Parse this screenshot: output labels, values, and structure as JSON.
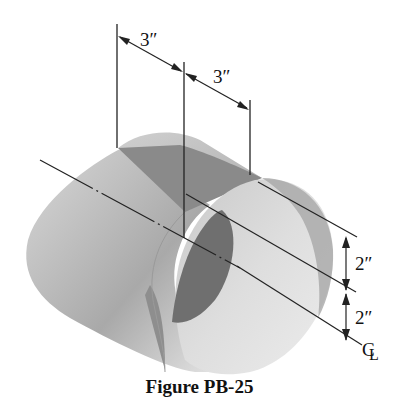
{
  "figure": {
    "caption": "Figure PB-25",
    "colors": {
      "background": "#ffffff",
      "line": "#222222",
      "surface_light": "#e6e6e6",
      "surface_mid": "#bdbdbd",
      "surface_dark": "#7d7d7d"
    }
  },
  "dimensions": {
    "top_left": "3″",
    "top_right": "3″",
    "right_upper": "2″",
    "right_lower": "2″"
  },
  "labels": {
    "centerline": "C",
    "centerline_sub": "L"
  }
}
